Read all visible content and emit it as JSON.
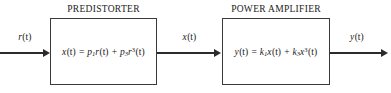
{
  "diagram": {
    "blocks": [
      {
        "id": "predistorter",
        "title": "PREDISTORTER",
        "equation_plain": "x(t) = p1 r(t) + p3 r^3(t)",
        "equation": {
          "lhs_var": "x",
          "lhs_arg": "(t)",
          "equals": "=",
          "term1_coeff": "p",
          "term1_coeff_sub": "1",
          "term1_var": "r",
          "term1_arg": "(t)",
          "plus": "+",
          "term2_coeff": "p",
          "term2_coeff_sub": "3",
          "term2_var": "r",
          "term2_exp": "3",
          "term2_arg": "(t)"
        }
      },
      {
        "id": "power-amplifier",
        "title": "POWER AMPLIFIER",
        "equation_plain": "y(t) = k1 x(t) + k3 x^3(t)",
        "equation": {
          "lhs_var": "y",
          "lhs_arg": "(t)",
          "equals": "=",
          "term1_coeff": "k",
          "term1_coeff_sub": "1",
          "term1_var": "x",
          "term1_arg": "(t)",
          "plus": "+",
          "term2_coeff": "k",
          "term2_coeff_sub": "3",
          "term2_var": "x",
          "term2_exp": "3",
          "term2_arg": "(t)"
        }
      }
    ],
    "signals": [
      {
        "id": "input",
        "var": "r",
        "arg": "(t)",
        "plain": "r(t)"
      },
      {
        "id": "intermediate",
        "var": "x",
        "arg": "(t)",
        "plain": "x(t)"
      },
      {
        "id": "output",
        "var": "y",
        "arg": "(t)",
        "plain": "y(t)"
      }
    ],
    "colors": {
      "background": "#ffffff",
      "line": "#2b2b2b",
      "box_border": "#3a3a3a",
      "text": "#1a1a1a"
    }
  }
}
